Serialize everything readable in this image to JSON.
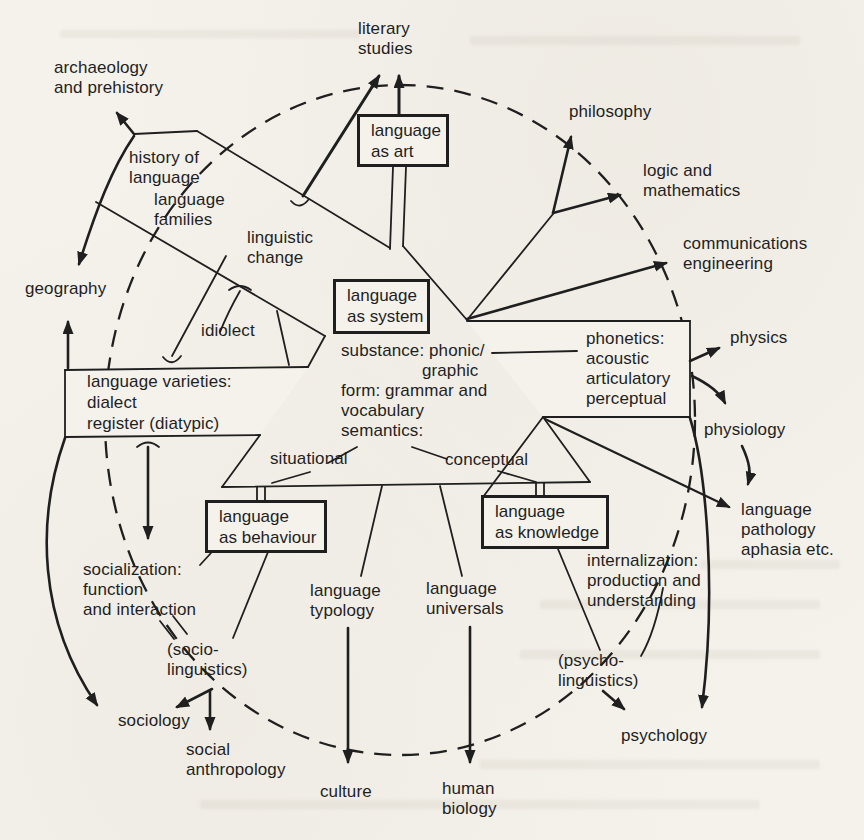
{
  "figure_title": "relationship of linguistics to neighbouring disciplines",
  "colors": {
    "ink": "#1f1f1f",
    "paper": "#f5f2ec"
  },
  "boxes": {
    "art": {
      "label": "language\nas art"
    },
    "system": {
      "label": "language\nas system"
    },
    "behaviour": {
      "label": "language\nas behaviour"
    },
    "knowledge": {
      "label": "language\nas knowledge"
    }
  },
  "outer": {
    "literary_studies": "literary\nstudies",
    "archaeology": "archaeology\nand prehistory",
    "philosophy": "philosophy",
    "logic_mathematics": "logic and\nmathematics",
    "communications_engineering": "communications\nengineering",
    "physics": "physics",
    "physiology": "physiology",
    "language_pathology": "language\npathology\naphasia etc.",
    "psychology": "psychology",
    "human_biology": "human\nbiology",
    "culture": "culture",
    "social_anthropology": "social\nanthropology",
    "sociology": "sociology",
    "geography": "geography"
  },
  "inner": {
    "history_of_language": "history of\nlanguage",
    "language_families": "language\nfamilies",
    "linguistic_change": "linguistic\nchange",
    "idiolect": "idiolect",
    "language_varieties": "language varieties:\ndialect\nregister (diatypic)",
    "situational": "situational",
    "conceptual": "conceptual",
    "phonetics": "phonetics:\nacoustic\narticulatory\nperceptual",
    "socialization": "socialization:\nfunction\nand interaction",
    "socio_linguistics": "(socio-\nlinguistics)",
    "psycho_linguistics": "(psycho-\nlinguistics)",
    "internalization": "internalization:\nproduction and\nunderstanding",
    "language_typology": "language\ntypology",
    "language_universals": "language\nuniversals"
  },
  "center_block": {
    "line1": "substance: phonic/",
    "line2": "graphic",
    "line3": "form: grammar and",
    "line4": "vocabulary",
    "line5": "semantics:"
  }
}
